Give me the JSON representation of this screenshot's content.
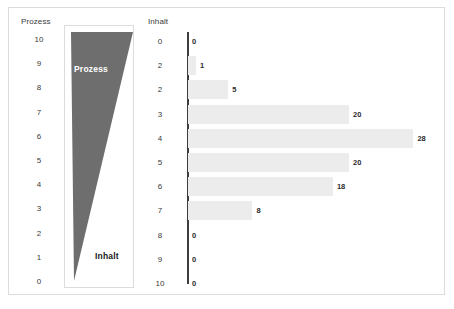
{
  "figure": {
    "background_color": "#ffffff",
    "border_color": "#d9dde0"
  },
  "left_panel": {
    "axis_title": "Prozess",
    "ticks": [
      "10",
      "9",
      "8",
      "7",
      "6",
      "5",
      "4",
      "3",
      "2",
      "1",
      "0"
    ],
    "wedge": {
      "fill_color": "#6e6e6e",
      "top_label": "Prozess",
      "bottom_label": "Inhalt"
    }
  },
  "chart_data": {
    "type": "bar",
    "orientation": "horizontal",
    "title": "",
    "xlabel": "",
    "ylabel": "Inhalt",
    "categories": [
      "0",
      "2",
      "2",
      "3",
      "4",
      "5",
      "6",
      "7",
      "8",
      "9",
      "10"
    ],
    "values": [
      0,
      1,
      5,
      20,
      28,
      20,
      18,
      8,
      0,
      0,
      0
    ],
    "value_labels": [
      "0",
      "1",
      "5",
      "20",
      "28",
      "20",
      "18",
      "8",
      "0",
      "0",
      "0"
    ],
    "xlim": [
      0,
      30
    ],
    "grid": false,
    "legend": false,
    "bar_color": "#ececec",
    "axis_color": "#3d3d3d"
  }
}
